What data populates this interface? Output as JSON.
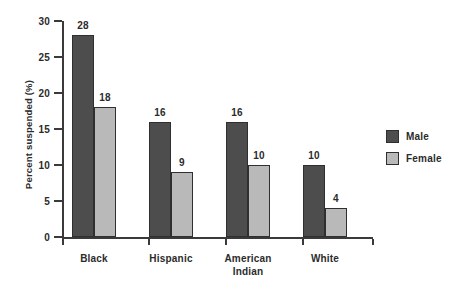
{
  "chart_data": {
    "type": "bar",
    "title": "",
    "xlabel": "",
    "ylabel": "Percent suspended (%)",
    "categories": [
      "Black",
      "Hispanic",
      "American Indian",
      "White"
    ],
    "category_lines": [
      [
        "Black"
      ],
      [
        "Hispanic"
      ],
      [
        "American",
        "Indian"
      ],
      [
        "White"
      ]
    ],
    "series": [
      {
        "name": "Male",
        "values": [
          28,
          16,
          16,
          10
        ],
        "color": "#4d4d4d"
      },
      {
        "name": "Female",
        "values": [
          18,
          9,
          10,
          4
        ],
        "color": "#b9b9b9"
      }
    ],
    "ylim": [
      0,
      30
    ],
    "yticks": [
      0,
      5,
      10,
      15,
      20,
      25,
      30
    ],
    "ytick_labels": [
      "0",
      "5",
      "10",
      "15",
      "20",
      "25",
      "30"
    ],
    "grid": false,
    "legend_position": "right",
    "data_labels": true
  },
  "legend": {
    "entries": [
      {
        "label": "Male",
        "swatch": "male-swatch"
      },
      {
        "label": "Female",
        "swatch": "female-swatch"
      }
    ]
  },
  "colors": {
    "male": "#4d4d4d",
    "female": "#b9b9b9",
    "axis": "#3a3a3a",
    "text": "#2b2b2b",
    "background": "#ffffff"
  }
}
